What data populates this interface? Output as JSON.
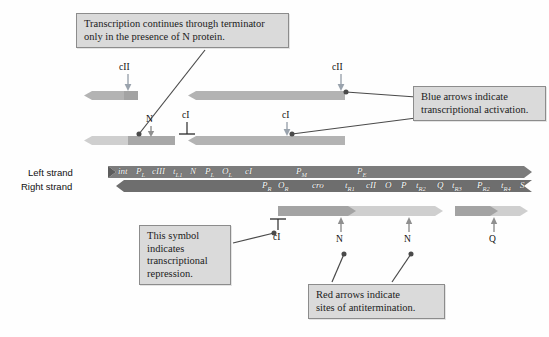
{
  "figure": {
    "background": "#fefefe"
  },
  "colors": {
    "callout_fill": "#dadada",
    "callout_border": "#8c8c8c",
    "blue_arrow": "#9aa3ad",
    "red_arrow": "#8f8f8f",
    "strand_dark": "#7a7a7a",
    "strand_mid": "#9a9a9a",
    "transcript_mid": "#a8a8a8",
    "transcript_light": "#cfcfcf",
    "leader": "#4c4c4c"
  },
  "callouts": [
    {
      "id": "terminator-note",
      "lines": [
        "Transcription continues through terminator",
        "only in the presence of N protein."
      ]
    },
    {
      "id": "blue-arrow-note",
      "lines": [
        "Blue arrows indicate",
        "transcriptional  activation."
      ]
    },
    {
      "id": "repression-note",
      "lines": [
        "This symbol",
        "indicates",
        "transcriptional",
        "repression."
      ]
    },
    {
      "id": "red-arrow-note",
      "lines": [
        "Red arrows indicate",
        "sites of antitermination."
      ]
    }
  ],
  "strands": {
    "left": {
      "label": "Left strand",
      "genes": [
        {
          "name": "int",
          "sub": ""
        },
        {
          "name": "P",
          "sub": "L"
        },
        {
          "name": "cIII",
          "sub": ""
        },
        {
          "name": "t",
          "sub": "L1"
        },
        {
          "name": "N",
          "sub": ""
        },
        {
          "name": "P",
          "sub": "L"
        },
        {
          "name": "O",
          "sub": "L"
        },
        {
          "name": "cI",
          "sub": ""
        },
        {
          "name": "P",
          "sub": "M"
        },
        {
          "name": "P",
          "sub": "E"
        }
      ]
    },
    "right": {
      "label": "Right strand",
      "genes": [
        {
          "name": "P",
          "sub": "R"
        },
        {
          "name": "O",
          "sub": "R"
        },
        {
          "name": "cro",
          "sub": ""
        },
        {
          "name": "t",
          "sub": "R1"
        },
        {
          "name": "cII",
          "sub": ""
        },
        {
          "name": "O",
          "sub": ""
        },
        {
          "name": "P",
          "sub": ""
        },
        {
          "name": "t",
          "sub": "R2"
        },
        {
          "name": "Q",
          "sub": ""
        },
        {
          "name": "t",
          "sub": "R3"
        },
        {
          "name": "P",
          "sub": "R2"
        },
        {
          "name": "t",
          "sub": "R4"
        },
        {
          "name": "S",
          "sub": ""
        }
      ]
    }
  },
  "annotations": {
    "activation_top_left": "cII",
    "activation_top_right": "cII",
    "n_antitermination": "N",
    "repression_mid_left": "cI",
    "activation_mid_right": "cI",
    "repression_bottom": "cI",
    "n_bottom_left": "N",
    "n_bottom_right": "N",
    "q_bottom": "Q"
  }
}
